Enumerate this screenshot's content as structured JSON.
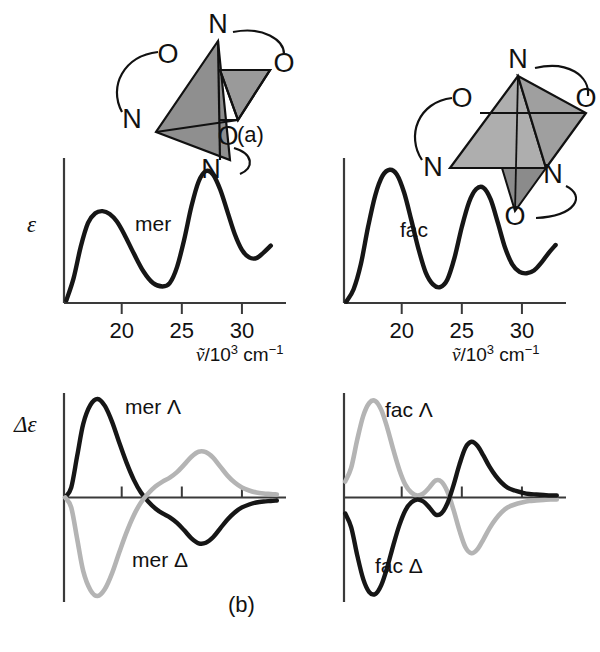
{
  "figure": {
    "panels": [
      {
        "tag": "(a)",
        "x": 237,
        "y": 122
      },
      {
        "tag": "(b)",
        "x": 228,
        "y": 592
      }
    ]
  },
  "axes": {
    "x_label_parts": {
      "symbol": "ṽ",
      "slash": "/10",
      "exp": "3",
      "unit": " cm",
      "unit_exp": "−1"
    },
    "x_ticks": [
      20,
      25,
      30
    ],
    "y_label_absorption": "ε",
    "y_label_cd": "Δε",
    "x_range": [
      15.2,
      33.0
    ]
  },
  "structures": [
    {
      "name": "mer-isomer-diagram",
      "vertices": [
        {
          "label": "N",
          "x": 130,
          "y": 18
        },
        {
          "label": "O",
          "x": 80,
          "y": 48
        },
        {
          "label": "O",
          "x": 196,
          "y": 57
        },
        {
          "label": "N",
          "x": 44,
          "y": 113
        },
        {
          "label": "O",
          "x": 140,
          "y": 130
        },
        {
          "label": "N",
          "x": 123,
          "y": 163
        }
      ]
    },
    {
      "name": "fac-isomer-diagram",
      "vertices": [
        {
          "label": "N",
          "x": 128,
          "y": 33
        },
        {
          "label": "O",
          "x": 72,
          "y": 72
        },
        {
          "label": "O",
          "x": 196,
          "y": 72
        },
        {
          "label": "N",
          "x": 43,
          "y": 141
        },
        {
          "label": "N",
          "x": 163,
          "y": 148
        },
        {
          "label": "O",
          "x": 125,
          "y": 190
        }
      ]
    }
  ],
  "colors": {
    "curve_dark": "#161616",
    "curve_light": "#b4b4b4",
    "axis": "#3a3a3a",
    "text": "#111111"
  },
  "chart_data": [
    {
      "type": "line",
      "id": "mer-absorption",
      "title": "mer",
      "xlabel": "ṽ/10³ cm⁻¹",
      "ylabel": "ε",
      "xlim": [
        15.2,
        33.0
      ],
      "ylim": [
        0,
        1.05
      ],
      "grid": false,
      "legend": "inline-label",
      "series": [
        {
          "name": "mer",
          "color": "#161616",
          "x": [
            15.4,
            16.0,
            16.6,
            17.2,
            17.8,
            18.4,
            19.0,
            19.6,
            20.2,
            21.0,
            21.8,
            22.6,
            23.4,
            24.0,
            24.6,
            25.2,
            25.8,
            26.4,
            27.0,
            27.6,
            28.2,
            28.8,
            29.4,
            30.0,
            30.6,
            31.2,
            31.8,
            32.4
          ],
          "y": [
            0.02,
            0.18,
            0.41,
            0.58,
            0.65,
            0.665,
            0.645,
            0.59,
            0.5,
            0.36,
            0.23,
            0.145,
            0.12,
            0.145,
            0.26,
            0.46,
            0.7,
            0.88,
            0.955,
            0.93,
            0.82,
            0.66,
            0.5,
            0.385,
            0.33,
            0.325,
            0.365,
            0.415
          ]
        }
      ],
      "peaks": [
        {
          "x": 18.3,
          "y": 0.665
        },
        {
          "x": 27.1,
          "y": 0.955
        }
      ],
      "minima": [
        {
          "x": 23.4,
          "y": 0.12
        },
        {
          "x": 31.2,
          "y": 0.325
        }
      ]
    },
    {
      "type": "line",
      "id": "fac-absorption",
      "title": "fac",
      "xlabel": "ṽ/10³ cm⁻¹",
      "ylabel": "ε",
      "xlim": [
        15.2,
        33.0
      ],
      "ylim": [
        0,
        1.05
      ],
      "grid": false,
      "legend": "inline-label",
      "series": [
        {
          "name": "fac",
          "color": "#161616",
          "x": [
            15.4,
            16.0,
            16.6,
            17.2,
            17.8,
            18.4,
            19.0,
            19.6,
            20.2,
            20.8,
            21.4,
            22.0,
            22.6,
            23.2,
            23.8,
            24.4,
            25.0,
            25.6,
            26.2,
            26.8,
            27.4,
            28.0,
            28.6,
            29.2,
            29.8,
            30.4,
            31.0,
            31.6,
            32.2,
            32.8
          ],
          "y": [
            0.01,
            0.1,
            0.28,
            0.55,
            0.78,
            0.92,
            0.965,
            0.93,
            0.8,
            0.6,
            0.39,
            0.22,
            0.135,
            0.115,
            0.17,
            0.33,
            0.55,
            0.73,
            0.825,
            0.835,
            0.75,
            0.58,
            0.4,
            0.28,
            0.225,
            0.215,
            0.235,
            0.29,
            0.36,
            0.42
          ]
        }
      ],
      "peaks": [
        {
          "x": 19.1,
          "y": 0.965
        },
        {
          "x": 26.5,
          "y": 0.84
        }
      ],
      "minima": [
        {
          "x": 23.1,
          "y": 0.115
        },
        {
          "x": 30.3,
          "y": 0.215
        }
      ]
    },
    {
      "type": "line",
      "id": "mer-cd",
      "title": "mer circular dichroism",
      "xlabel": "ṽ/10³ cm⁻¹",
      "ylabel": "Δε",
      "xlim": [
        15.2,
        33.0
      ],
      "ylim": [
        -1.05,
        1.05
      ],
      "grid": false,
      "zero_line": true,
      "series": [
        {
          "name": "mer Λ",
          "color": "#161616",
          "label_pos": {
            "x": 19.6,
            "y": 0.82
          },
          "x": [
            15.3,
            15.8,
            16.3,
            16.8,
            17.4,
            18.0,
            18.6,
            19.2,
            19.8,
            20.4,
            21.0,
            21.6,
            22.2,
            22.8,
            23.4,
            24.0,
            24.6,
            25.2,
            25.8,
            26.4,
            27.0,
            27.6,
            28.2,
            28.8,
            29.4,
            30.0,
            30.6,
            31.2,
            31.8,
            32.4,
            32.9
          ],
          "y": [
            0.0,
            0.1,
            0.42,
            0.74,
            0.93,
            0.99,
            0.92,
            0.76,
            0.55,
            0.35,
            0.18,
            0.05,
            -0.04,
            -0.11,
            -0.16,
            -0.2,
            -0.255,
            -0.33,
            -0.41,
            -0.46,
            -0.455,
            -0.4,
            -0.31,
            -0.22,
            -0.15,
            -0.1,
            -0.07,
            -0.05,
            -0.04,
            -0.035,
            -0.03
          ]
        },
        {
          "name": "mer Δ",
          "color": "#b4b4b4",
          "label_pos": {
            "x": 20.2,
            "y": -0.7
          },
          "x": [
            15.3,
            15.8,
            16.3,
            16.8,
            17.4,
            18.0,
            18.6,
            19.2,
            19.8,
            20.4,
            21.0,
            21.6,
            22.2,
            22.8,
            23.4,
            24.0,
            24.6,
            25.2,
            25.8,
            26.4,
            27.0,
            27.6,
            28.2,
            28.8,
            29.4,
            30.0,
            30.6,
            31.2,
            31.8,
            32.4,
            32.9
          ],
          "y": [
            0.0,
            -0.1,
            -0.42,
            -0.74,
            -0.93,
            -0.99,
            -0.92,
            -0.76,
            -0.55,
            -0.35,
            -0.18,
            -0.05,
            0.04,
            0.11,
            0.16,
            0.2,
            0.255,
            0.33,
            0.41,
            0.46,
            0.455,
            0.4,
            0.31,
            0.22,
            0.15,
            0.1,
            0.07,
            0.05,
            0.04,
            0.035,
            0.03
          ]
        }
      ]
    },
    {
      "type": "line",
      "id": "fac-cd",
      "title": "fac circular dichroism",
      "xlabel": "ṽ/10³ cm⁻¹",
      "ylabel": "Δε",
      "xlim": [
        15.2,
        33.0
      ],
      "ylim": [
        -1.05,
        1.05
      ],
      "grid": false,
      "zero_line": true,
      "series": [
        {
          "name": "fac Λ",
          "color": "#b4b4b4",
          "label_pos": {
            "x": 19.5,
            "y": 0.8
          },
          "x": [
            15.3,
            15.8,
            16.3,
            16.8,
            17.3,
            17.8,
            18.3,
            18.8,
            19.3,
            19.8,
            20.3,
            20.8,
            21.3,
            21.8,
            22.3,
            22.8,
            23.3,
            23.8,
            24.3,
            24.8,
            25.3,
            25.8,
            26.3,
            26.8,
            27.3,
            27.8,
            28.3,
            28.8,
            29.4,
            30.0,
            30.6,
            31.2,
            31.8,
            32.4,
            32.9
          ],
          "y": [
            0.16,
            0.3,
            0.58,
            0.82,
            0.95,
            0.97,
            0.88,
            0.7,
            0.48,
            0.28,
            0.13,
            0.05,
            0.02,
            0.04,
            0.1,
            0.17,
            0.16,
            0.06,
            -0.12,
            -0.33,
            -0.5,
            -0.56,
            -0.52,
            -0.42,
            -0.31,
            -0.22,
            -0.15,
            -0.1,
            -0.07,
            -0.05,
            -0.035,
            -0.03,
            -0.025,
            -0.02,
            -0.02
          ]
        },
        {
          "name": "fac Δ",
          "color": "#161616",
          "label_pos": {
            "x": 21.3,
            "y": -0.72
          },
          "x": [
            15.3,
            15.8,
            16.3,
            16.8,
            17.3,
            17.8,
            18.3,
            18.8,
            19.3,
            19.8,
            20.3,
            20.8,
            21.3,
            21.8,
            22.3,
            22.8,
            23.3,
            23.8,
            24.3,
            24.8,
            25.3,
            25.8,
            26.3,
            26.8,
            27.3,
            27.8,
            28.3,
            28.8,
            29.4,
            30.0,
            30.6,
            31.2,
            31.8,
            32.4,
            32.9
          ],
          "y": [
            -0.16,
            -0.3,
            -0.58,
            -0.82,
            -0.95,
            -0.97,
            -0.88,
            -0.7,
            -0.48,
            -0.28,
            -0.13,
            -0.05,
            -0.02,
            -0.04,
            -0.1,
            -0.17,
            -0.16,
            -0.06,
            0.12,
            0.33,
            0.5,
            0.56,
            0.52,
            0.42,
            0.31,
            0.22,
            0.15,
            0.1,
            0.07,
            0.05,
            0.035,
            0.03,
            0.025,
            0.02,
            0.02
          ]
        }
      ]
    }
  ],
  "curve_labels": [
    {
      "text": "mer",
      "x": 135,
      "y": 212
    },
    {
      "text": "fac",
      "x": 400,
      "y": 218
    },
    {
      "text": "mer Λ",
      "x": 125,
      "y": 395
    },
    {
      "text": "mer Δ",
      "x": 132,
      "y": 548
    },
    {
      "text": "fac Λ",
      "x": 385,
      "y": 398
    },
    {
      "text": "fac Δ",
      "x": 375,
      "y": 554
    }
  ]
}
